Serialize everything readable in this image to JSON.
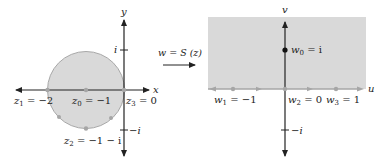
{
  "colors": {
    "shade": "#d9d9d9",
    "shade_stroke": "#a8a8a8",
    "axis": "#222222",
    "gray_dot": "#a6a6a6",
    "black_dot": "#111111"
  },
  "left_panel": {
    "axis_x_label": "x",
    "axis_y_label": "y",
    "tick_i": "i",
    "tick_neg_i": "−i",
    "region": "disk centered at −1 with radius 1",
    "points": [
      {
        "name": "z1",
        "base": "z",
        "sub": "1",
        "value": " = −2"
      },
      {
        "name": "z0",
        "base": "z",
        "sub": "0",
        "value": " = −1"
      },
      {
        "name": "z3",
        "base": "z",
        "sub": "3",
        "value": " = 0"
      },
      {
        "name": "z2",
        "base": "z",
        "sub": "2",
        "value": " = −1 − i"
      }
    ]
  },
  "mapping": {
    "label_lhs": "w = S (z)"
  },
  "right_panel": {
    "axis_u_label": "u",
    "axis_v_label": "v",
    "tick_neg_i": "−i",
    "region": "upper half-plane",
    "points": [
      {
        "name": "w0",
        "base": "w",
        "sub": "0",
        "value": " = i"
      },
      {
        "name": "w1",
        "base": "w",
        "sub": "1",
        "value": " = −1"
      },
      {
        "name": "w2",
        "base": "w",
        "sub": "2",
        "value": " = 0"
      },
      {
        "name": "w3",
        "base": "w",
        "sub": "3",
        "value": " = 1"
      }
    ]
  }
}
